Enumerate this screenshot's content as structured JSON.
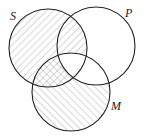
{
  "diagram": {
    "type": "venn-3",
    "sets": [
      {
        "id": "S",
        "label": "S",
        "cx": 48,
        "cy": 48,
        "r": 39,
        "label_x": 10,
        "label_y": 20
      },
      {
        "id": "P",
        "label": "P",
        "cx": 96,
        "cy": 46,
        "r": 39,
        "label_x": 125,
        "label_y": 17
      },
      {
        "id": "M",
        "label": "M",
        "cx": 71,
        "cy": 92,
        "r": 39,
        "label_x": 111,
        "label_y": 110
      }
    ],
    "shaded_regions": [
      "S only",
      "S∩P (not M)",
      "S∩M (not P)",
      "M only"
    ],
    "unshaded_regions": [
      "P only",
      "P∩M (not S)",
      "S∩P∩M"
    ],
    "colors": {
      "stroke": "#222222",
      "hatch": "#9a9a9a",
      "background": "#ffffff"
    }
  }
}
